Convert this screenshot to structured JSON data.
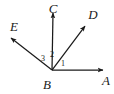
{
  "figure": {
    "type": "geometry-diagram",
    "background_color": "#ffffff",
    "stroke_color": "#1a1a1a",
    "text_color": "#1a1a1a",
    "width": 114,
    "height": 94,
    "vertex": {
      "name": "B",
      "label": "B",
      "x": 52,
      "y": 70,
      "label_x": 47,
      "label_y": 83
    },
    "rays": [
      {
        "name": "ray-BA",
        "label": "A",
        "from_x": 52,
        "from_y": 70,
        "to_x": 103,
        "to_y": 70,
        "label_x": 107,
        "label_y": 80,
        "arrowhead": true
      },
      {
        "name": "ray-BD",
        "label": "D",
        "from_x": 52,
        "from_y": 70,
        "to_x": 85,
        "to_y": 26,
        "label_x": 93,
        "label_y": 14,
        "arrowhead": true
      },
      {
        "name": "ray-BC",
        "label": "C",
        "from_x": 52,
        "from_y": 70,
        "to_x": 53,
        "to_y": 13,
        "label_x": 53,
        "label_y": 7,
        "arrowhead": true
      },
      {
        "name": "ray-BE",
        "label": "E",
        "from_x": 52,
        "from_y": 70,
        "to_x": 11,
        "to_y": 38,
        "label_x": 14,
        "label_y": 26,
        "arrowhead": true
      }
    ],
    "angles": [
      {
        "name": "angle-1",
        "label": "1",
        "between": [
          "ray-BA",
          "ray-BD"
        ],
        "label_x": 63,
        "label_y": 64
      },
      {
        "name": "angle-2",
        "label": "2",
        "between": [
          "ray-BD",
          "ray-BC"
        ],
        "label_x": 52,
        "label_y": 55
      },
      {
        "name": "angle-3",
        "label": "3",
        "between": [
          "ray-BC",
          "ray-BE"
        ],
        "label_x": 43,
        "label_y": 59
      }
    ]
  }
}
